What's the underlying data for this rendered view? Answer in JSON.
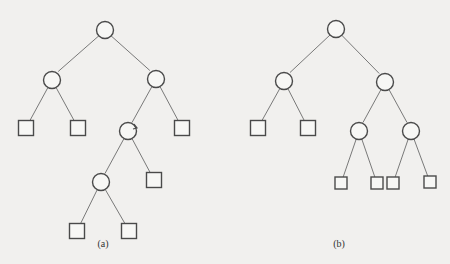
{
  "diagram": {
    "type": "binary-trees",
    "colors": {
      "background": "#f1f0ee",
      "stroke": "#4a4a4a",
      "edge": "#6b6b6b"
    },
    "trees": [
      {
        "id": "a",
        "caption": "(a)",
        "caption_pos": [
          103,
          247
        ],
        "nodes": [
          {
            "id": "a0",
            "shape": "circle",
            "x": 105,
            "y": 30
          },
          {
            "id": "a1",
            "shape": "circle",
            "x": 52,
            "y": 80
          },
          {
            "id": "a2",
            "shape": "circle",
            "x": 156,
            "y": 79
          },
          {
            "id": "a3",
            "shape": "square",
            "x": 26,
            "y": 128
          },
          {
            "id": "a4",
            "shape": "square",
            "x": 78,
            "y": 128
          },
          {
            "id": "a5",
            "shape": "circle",
            "x": 128,
            "y": 131
          },
          {
            "id": "a6",
            "shape": "square",
            "x": 182,
            "y": 128
          },
          {
            "id": "a7",
            "shape": "circle",
            "x": 101,
            "y": 182
          },
          {
            "id": "a8",
            "shape": "square",
            "x": 154,
            "y": 180
          },
          {
            "id": "a9",
            "shape": "square",
            "x": 77,
            "y": 231
          },
          {
            "id": "a10",
            "shape": "square",
            "x": 129,
            "y": 231
          }
        ],
        "edges": [
          [
            "a0",
            "a1"
          ],
          [
            "a0",
            "a2"
          ],
          [
            "a1",
            "a3"
          ],
          [
            "a1",
            "a4"
          ],
          [
            "a2",
            "a5"
          ],
          [
            "a2",
            "a6"
          ],
          [
            "a5",
            "a7"
          ],
          [
            "a5",
            "a8"
          ],
          [
            "a7",
            "a9"
          ],
          [
            "a7",
            "a10"
          ]
        ]
      },
      {
        "id": "b",
        "caption": "(b)",
        "caption_pos": [
          339,
          247
        ],
        "nodes": [
          {
            "id": "b0",
            "shape": "circle",
            "x": 336,
            "y": 29
          },
          {
            "id": "b1",
            "shape": "circle",
            "x": 284,
            "y": 81
          },
          {
            "id": "b2",
            "shape": "circle",
            "x": 385,
            "y": 82
          },
          {
            "id": "b3",
            "shape": "square",
            "x": 258,
            "y": 128
          },
          {
            "id": "b4",
            "shape": "square",
            "x": 308,
            "y": 128
          },
          {
            "id": "b5",
            "shape": "circle",
            "x": 359,
            "y": 131
          },
          {
            "id": "b6",
            "shape": "circle",
            "x": 411,
            "y": 131
          },
          {
            "id": "b7",
            "shape": "square",
            "x": 341,
            "y": 183,
            "small": true
          },
          {
            "id": "b8",
            "shape": "square",
            "x": 377,
            "y": 183,
            "small": true
          },
          {
            "id": "b9",
            "shape": "square",
            "x": 393,
            "y": 183,
            "small": true
          },
          {
            "id": "b10",
            "shape": "square",
            "x": 430,
            "y": 182,
            "small": true
          }
        ],
        "edges": [
          [
            "b0",
            "b1"
          ],
          [
            "b0",
            "b2"
          ],
          [
            "b1",
            "b3"
          ],
          [
            "b1",
            "b4"
          ],
          [
            "b2",
            "b5"
          ],
          [
            "b2",
            "b6"
          ],
          [
            "b5",
            "b7"
          ],
          [
            "b5",
            "b8"
          ],
          [
            "b6",
            "b9"
          ],
          [
            "b6",
            "b10"
          ]
        ]
      }
    ]
  }
}
